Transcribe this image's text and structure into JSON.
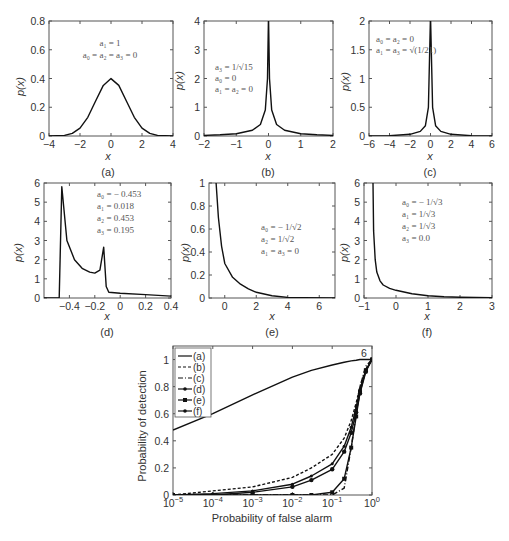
{
  "chart_data": [
    {
      "id": "a",
      "type": "line",
      "caption": "(a)",
      "xlabel": "x",
      "ylabel": "p(x)",
      "xlim": [
        -4,
        4
      ],
      "ylim": [
        0,
        0.8
      ],
      "xticks": [
        "-4",
        "-2",
        "0",
        "2",
        "4"
      ],
      "yticks": [
        "0",
        "0.2",
        "0.4",
        "0.6",
        "0.8"
      ],
      "annotation": [
        "a1 = 1",
        "a0 = a2 = a3 = 0"
      ],
      "description": "Gaussian-like density peaked at x=0 with p(0)≈0.4",
      "x": [
        -4,
        -3,
        -2.5,
        -2,
        -1.5,
        -1,
        -0.5,
        0,
        0.5,
        1,
        1.5,
        2,
        2.5,
        3,
        4
      ],
      "values": [
        0.0,
        0.004,
        0.018,
        0.054,
        0.13,
        0.242,
        0.352,
        0.399,
        0.352,
        0.242,
        0.13,
        0.054,
        0.018,
        0.004,
        0.0
      ]
    },
    {
      "id": "b",
      "type": "line",
      "caption": "(b)",
      "xlabel": "x",
      "ylabel": "p(x)",
      "xlim": [
        -2,
        2
      ],
      "ylim": [
        0,
        4
      ],
      "xticks": [
        "-2",
        "-1",
        "0",
        "1",
        "2"
      ],
      "yticks": [
        "0",
        "1",
        "2",
        "3",
        "4"
      ],
      "annotation": [
        "a3 = 1/√15",
        "a0 = 0",
        "a1 = a2 = 0"
      ],
      "description": "Sharply peaked symmetric density at x=0 exceeding 4",
      "x": [
        -2,
        -1.5,
        -1,
        -0.5,
        -0.25,
        -0.1,
        -0.03,
        0,
        0.03,
        0.1,
        0.25,
        0.5,
        1,
        1.5,
        2
      ],
      "values": [
        0.02,
        0.04,
        0.08,
        0.2,
        0.4,
        0.9,
        2.0,
        4.2,
        2.0,
        0.9,
        0.4,
        0.2,
        0.08,
        0.04,
        0.02
      ]
    },
    {
      "id": "c",
      "type": "line",
      "caption": "(c)",
      "xlabel": "x",
      "ylabel": "p(x)",
      "xlim": [
        -6,
        6
      ],
      "ylim": [
        0,
        2
      ],
      "xticks": [
        "-6",
        "-4",
        "-2",
        "0",
        "2",
        "4",
        "6"
      ],
      "yticks": [
        "0",
        "0.5",
        "1",
        "1.5",
        "2"
      ],
      "annotation": [
        "a0 = a2 = 0",
        "a1 = a3 = √(1/21)"
      ],
      "description": "Sharply peaked symmetric density at x=0 exceeding 2",
      "x": [
        -6,
        -4,
        -2,
        -1,
        -0.5,
        -0.2,
        0,
        0.2,
        0.5,
        1,
        2,
        4,
        6
      ],
      "values": [
        0.0,
        0.005,
        0.03,
        0.08,
        0.18,
        0.5,
        2.1,
        0.5,
        0.18,
        0.08,
        0.03,
        0.005,
        0.0
      ]
    },
    {
      "id": "d",
      "type": "line",
      "caption": "(d)",
      "xlabel": "x",
      "ylabel": "p(x)",
      "xlim": [
        -0.6,
        0.4
      ],
      "ylim": [
        0,
        6
      ],
      "xticks": [
        "-0.4",
        "-0.2",
        "0",
        "0.2",
        "0.4"
      ],
      "yticks": [
        "0",
        "1",
        "2",
        "3",
        "4",
        "5",
        "6"
      ],
      "annotation": [
        "a0 = − 0.453",
        "a1 = 0.018",
        "a2 = 0.453",
        "a3 = 0.195"
      ],
      "description": "Bimodal density: zero until x≈-0.48, spike to ~5.8 at x≈-0.46, decays to ~1.3, second spike ~2.6 at x≈-0.13, then ~0.3 tapering to ~0.1 at 0.4",
      "x": [
        -0.6,
        -0.48,
        -0.46,
        -0.42,
        -0.36,
        -0.3,
        -0.24,
        -0.2,
        -0.16,
        -0.13,
        -0.11,
        -0.09,
        0.0,
        0.2,
        0.4
      ],
      "values": [
        0,
        0,
        5.8,
        3.0,
        2.0,
        1.55,
        1.35,
        1.3,
        1.45,
        2.65,
        0.6,
        0.3,
        0.25,
        0.18,
        0.1
      ]
    },
    {
      "id": "e",
      "type": "line",
      "caption": "(e)",
      "xlabel": "x",
      "ylabel": "p(x)",
      "xlim": [
        -1,
        7
      ],
      "ylim": [
        0,
        1
      ],
      "xticks": [
        "0",
        "2",
        "4",
        "6"
      ],
      "yticks": [
        "0",
        "0.2",
        "0.4",
        "0.6",
        "0.8",
        "1"
      ],
      "annotation": [
        "a0 = − 1/√2",
        "a2 = 1/√2",
        "a1 = a3 = 0"
      ],
      "description": "Right-skewed decaying density starting near x≈-0.5 above 1 and decaying to 0 by x≈4",
      "x": [
        -0.55,
        -0.4,
        -0.2,
        0,
        0.5,
        1,
        1.5,
        2,
        3,
        4,
        5,
        7
      ],
      "values": [
        1.0,
        0.7,
        0.45,
        0.3,
        0.18,
        0.12,
        0.08,
        0.05,
        0.02,
        0.005,
        0.002,
        0.0
      ]
    },
    {
      "id": "f",
      "type": "line",
      "caption": "(f)",
      "xlabel": "x",
      "ylabel": "p(x)",
      "xlim": [
        -1,
        3
      ],
      "ylim": [
        0,
        6
      ],
      "xticks": [
        "-1",
        "0",
        "1",
        "2",
        "3"
      ],
      "yticks": [
        "0",
        "1",
        "2",
        "3",
        "4",
        "5",
        "6"
      ],
      "annotation": [
        "a0 = − 1/√3",
        "a1 = 1/√3",
        "a2 = 1/√3",
        "a3 = 0.0"
      ],
      "description": "Right-skewed density with vertical asymptote near x≈-0.72, decaying toward 0 by x=3",
      "x": [
        -0.72,
        -0.7,
        -0.65,
        -0.6,
        -0.5,
        -0.4,
        -0.2,
        0,
        0.5,
        1,
        1.5,
        2,
        3
      ],
      "values": [
        6.0,
        3.5,
        2.0,
        1.35,
        0.9,
        0.68,
        0.5,
        0.4,
        0.22,
        0.12,
        0.07,
        0.04,
        0.01
      ]
    },
    {
      "id": "roc",
      "type": "line",
      "title": "",
      "xlabel": "Probability of false alarm",
      "ylabel": "Probability of detection",
      "xscale": "log",
      "xlim": [
        1e-05,
        1
      ],
      "ylim": [
        0,
        1.1
      ],
      "xticks": [
        "10^-5",
        "10^-4",
        "10^-3",
        "10^-2",
        "10^-1",
        "10^0"
      ],
      "yticks": [
        "0",
        "0.2",
        "0.4",
        "0.6",
        "0.8",
        "1"
      ],
      "annotation": "6",
      "legend_position": "upper left",
      "x": [
        1e-05,
        0.0001,
        0.001,
        0.01,
        0.03,
        0.1,
        0.2,
        0.3,
        0.4,
        0.5,
        0.7,
        1
      ],
      "series": [
        {
          "name": "(a)",
          "style": "solid",
          "values": [
            0.48,
            0.6,
            0.74,
            0.87,
            0.92,
            0.96,
            0.98,
            0.99,
            0.995,
            1.0,
            1.0,
            1.0
          ]
        },
        {
          "name": "(b)",
          "style": "dashed",
          "values": [
            0.0,
            0.03,
            0.06,
            0.13,
            0.2,
            0.3,
            0.42,
            0.55,
            0.68,
            0.8,
            0.93,
            1.0
          ]
        },
        {
          "name": "(c)",
          "style": "dash-dot",
          "values": [
            0.0,
            0.0,
            0.0,
            0.0,
            0.0,
            0.0,
            0.05,
            0.35,
            0.6,
            0.8,
            0.95,
            1.0
          ]
        },
        {
          "name": "(d)",
          "style": "solid-dot",
          "values": [
            0.0,
            0.01,
            0.03,
            0.08,
            0.14,
            0.23,
            0.36,
            0.5,
            0.65,
            0.78,
            0.92,
            1.0
          ]
        },
        {
          "name": "(e)",
          "style": "square-marker",
          "values": [
            0.0,
            0.0,
            0.0,
            0.0,
            0.0,
            0.02,
            0.12,
            0.35,
            0.58,
            0.76,
            0.92,
            1.0
          ]
        },
        {
          "name": "(f)",
          "style": "star-marker",
          "values": [
            0.0,
            0.0,
            0.02,
            0.06,
            0.11,
            0.19,
            0.32,
            0.46,
            0.61,
            0.75,
            0.91,
            1.0
          ]
        }
      ]
    }
  ],
  "panels": {
    "a": {
      "caption": "(a)",
      "xlabel": "x",
      "ylabel": "p(x)",
      "ann": [
        "a₁ = 1",
        "a₀ = a₂ = a₃ = 0"
      ]
    },
    "b": {
      "caption": "(b)",
      "xlabel": "x",
      "ylabel": "p(x)",
      "ann": [
        "a₃ = 1/√15",
        "a₀ = 0",
        "a₁ = a₂ = 0"
      ]
    },
    "c": {
      "caption": "(c)",
      "xlabel": "x",
      "ylabel": "p(x)",
      "ann": [
        "a₀ = a₂ = 0",
        "a₁ = a₃ = √(1/21)"
      ]
    },
    "d": {
      "caption": "(d)",
      "xlabel": "x",
      "ylabel": "p(x)",
      "ann": [
        "a₀ = − 0.453",
        "a₁ = 0.018",
        "a₂ = 0.453",
        "a₃ = 0.195"
      ]
    },
    "e": {
      "caption": "(e)",
      "xlabel": "x",
      "ylabel": "p(x)",
      "ann": [
        "a₀ = − 1/√2",
        "a₂ = 1/√2",
        "a₁ = a₃ = 0"
      ]
    },
    "f": {
      "caption": "(f)",
      "xlabel": "x",
      "ylabel": "p(x)",
      "ann": [
        "a₀ = − 1/√3",
        "a₁ = 1/√3",
        "a₂ = 1/√3",
        "a₃ = 0.0"
      ]
    },
    "roc": {
      "xlabel": "Probability of false alarm",
      "ylabel": "Probability of detection",
      "mark": "6",
      "legend": [
        "(a)",
        "(b)",
        "(c)",
        "(d)",
        "(e)",
        "(f)"
      ]
    }
  }
}
